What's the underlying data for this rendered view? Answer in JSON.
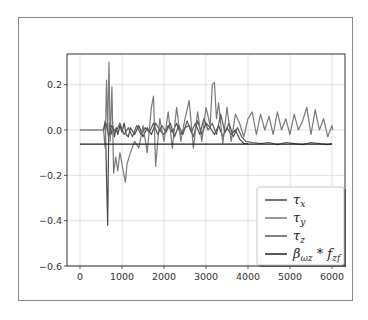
{
  "chart_data": {
    "type": "line",
    "title": "",
    "xlabel": "",
    "ylabel": "",
    "xlim": [
      -500,
      6200
    ],
    "ylim": [
      -0.6,
      0.33
    ],
    "grid": true,
    "legend_position": "lower right",
    "x_ticks": [
      0,
      1000,
      2000,
      3000,
      4000,
      5000,
      6000
    ],
    "x_tick_labels": [
      "0",
      "1000",
      "2000",
      "3000",
      "4000",
      "5000",
      "6000"
    ],
    "y_ticks": [
      0.2,
      0.0,
      -0.2,
      -0.4,
      -0.6
    ],
    "y_tick_labels": [
      "0.2",
      "0.0",
      "−0.2",
      "−0.4",
      "−0.6"
    ],
    "series": [
      {
        "name": "τx",
        "legend_main": "τ",
        "legend_sub": "x",
        "color": "#4a4a4a",
        "x": [
          0,
          560,
          600,
          620,
          640,
          660,
          680,
          700,
          740,
          780,
          820,
          860,
          900,
          950,
          1000,
          1050,
          1100,
          1150,
          1200,
          1300,
          1400,
          1500,
          1600,
          1700,
          1800,
          1900,
          2000,
          2100,
          2200,
          2300,
          2400,
          2500,
          2600,
          2700,
          2800,
          2900,
          3000,
          3100,
          3200,
          3300,
          3400,
          3500,
          3600,
          3700,
          3800,
          3900,
          4000
        ],
        "y": [
          0.0,
          0.0,
          0.04,
          -0.1,
          -0.28,
          -0.42,
          -0.05,
          0.03,
          -0.02,
          0.02,
          -0.03,
          0.01,
          -0.02,
          0.02,
          -0.01,
          0.03,
          -0.02,
          -0.03,
          0.01,
          -0.02,
          0.02,
          -0.03,
          0.01,
          -0.02,
          0.03,
          0.0,
          -0.02,
          0.02,
          -0.01,
          0.03,
          -0.02,
          0.01,
          0.02,
          -0.03,
          0.04,
          -0.02,
          0.03,
          0.01,
          -0.02,
          0.02,
          -0.03,
          0.01,
          -0.02,
          0.0,
          -0.04,
          -0.06,
          -0.06
        ]
      },
      {
        "name": "τy",
        "legend_main": "τ",
        "legend_sub": "y",
        "color": "#7a7a7a",
        "x": [
          560,
          600,
          630,
          660,
          690,
          720,
          760,
          800,
          850,
          900,
          950,
          1000,
          1050,
          1080,
          1120,
          1200,
          1300,
          1400,
          1500,
          1600,
          1700,
          1750,
          1800,
          1900,
          2000,
          2100,
          2200,
          2300,
          2400,
          2500,
          2600,
          2700,
          2800,
          2900,
          3000,
          3100,
          3150,
          3200,
          3250,
          3300,
          3400,
          3500,
          3600,
          3700,
          3800,
          3900,
          4000,
          4100,
          4200,
          4300,
          4400,
          4500,
          4600,
          4700,
          4800,
          4900,
          5000,
          5100,
          5200,
          5300,
          5400,
          5500,
          5600,
          5700,
          5800,
          5900,
          6000,
          6020
        ],
        "y": [
          0.0,
          -0.08,
          0.22,
          0.0,
          0.3,
          -0.05,
          0.19,
          -0.19,
          -0.12,
          -0.18,
          -0.1,
          -0.15,
          -0.2,
          -0.23,
          -0.15,
          -0.1,
          -0.05,
          -0.08,
          0.02,
          -0.1,
          0.1,
          0.15,
          -0.16,
          0.05,
          -0.05,
          0.08,
          -0.08,
          0.1,
          -0.05,
          0.05,
          0.13,
          -0.08,
          0.08,
          -0.05,
          0.1,
          0.02,
          0.2,
          0.21,
          0.05,
          0.12,
          -0.06,
          0.1,
          -0.05,
          0.07,
          0.03,
          -0.03,
          0.05,
          0.08,
          -0.02,
          0.07,
          0.0,
          0.06,
          -0.02,
          0.08,
          0.0,
          0.05,
          -0.02,
          0.07,
          0.0,
          0.04,
          0.1,
          -0.02,
          0.09,
          0.0,
          0.05,
          -0.03,
          0.02,
          0.0
        ]
      },
      {
        "name": "τz",
        "legend_main": "τ",
        "legend_sub": "z",
        "color": "#5a5a5a",
        "x": [
          560,
          620,
          680,
          750,
          850,
          950,
          1050,
          1150,
          1250,
          1350,
          1450,
          1550,
          1650,
          1750,
          1850,
          1950,
          2050,
          2150,
          2250,
          2350,
          2450,
          2550,
          2650,
          2750,
          2850,
          2950,
          3050,
          3150,
          3250,
          3350,
          3450,
          3550,
          3650,
          3750,
          3850,
          3950,
          4100,
          4300,
          4500,
          4700,
          4900,
          5100,
          5300,
          5500,
          5700,
          5900,
          6000
        ],
        "y": [
          0.0,
          0.03,
          -0.03,
          0.02,
          -0.01,
          0.03,
          -0.02,
          0.01,
          -0.03,
          0.02,
          -0.02,
          0.01,
          -0.01,
          0.03,
          -0.02,
          0.02,
          -0.01,
          0.03,
          -0.03,
          0.02,
          -0.02,
          0.04,
          -0.01,
          0.03,
          -0.02,
          0.05,
          0.0,
          0.03,
          -0.02,
          0.07,
          -0.01,
          0.03,
          -0.03,
          0.01,
          -0.03,
          -0.05,
          -0.055,
          -0.06,
          -0.055,
          -0.065,
          -0.055,
          -0.06,
          -0.065,
          -0.055,
          -0.06,
          -0.065,
          -0.06
        ]
      },
      {
        "name": "βωz * fzf",
        "legend_main": "β",
        "legend_sub": "ωz",
        "legend_mid": " * f",
        "legend_sub2": "zf",
        "color": "#1e1e1e",
        "x": [
          0,
          6000
        ],
        "y": [
          -0.062,
          -0.062
        ]
      }
    ]
  }
}
